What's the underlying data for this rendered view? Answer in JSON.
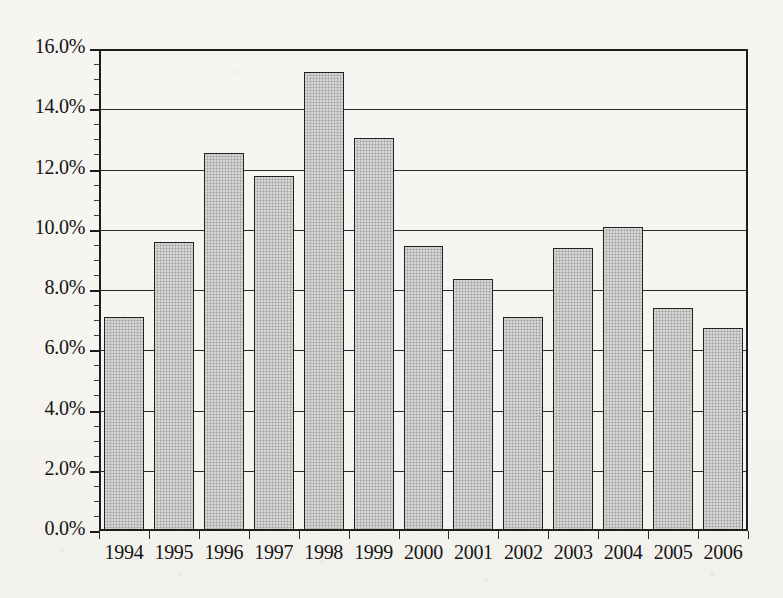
{
  "figure": {
    "background_color": "#f6f5f1",
    "bar_fill_color": "#bdbdbd",
    "bar_edge_color": "#222222",
    "axis_color": "#1c1c1c"
  },
  "chart_data": {
    "type": "bar",
    "title": "",
    "subtitle": "",
    "xlabel": "",
    "ylabel": "",
    "categories": [
      "1994",
      "1995",
      "1996",
      "1997",
      "1998",
      "1999",
      "2000",
      "2001",
      "2002",
      "2003",
      "2004",
      "2005",
      "2006"
    ],
    "values": [
      7.1,
      9.6,
      12.55,
      11.8,
      15.25,
      13.05,
      9.45,
      8.35,
      7.1,
      9.4,
      10.1,
      7.4,
      6.75
    ],
    "value_unit": "%",
    "ylim": [
      0.0,
      16.0
    ],
    "ytick_values": [
      0.0,
      2.0,
      4.0,
      6.0,
      8.0,
      10.0,
      12.0,
      14.0,
      16.0
    ],
    "ytick_labels": [
      "0.0%",
      "2.0%",
      "4.0%",
      "6.0%",
      "8.0%",
      "10.0%",
      "12.0%",
      "14.0%",
      "16.0%"
    ],
    "grid": true,
    "grid_axis": "y",
    "legend": false,
    "legend_position": "none",
    "annotations": []
  }
}
